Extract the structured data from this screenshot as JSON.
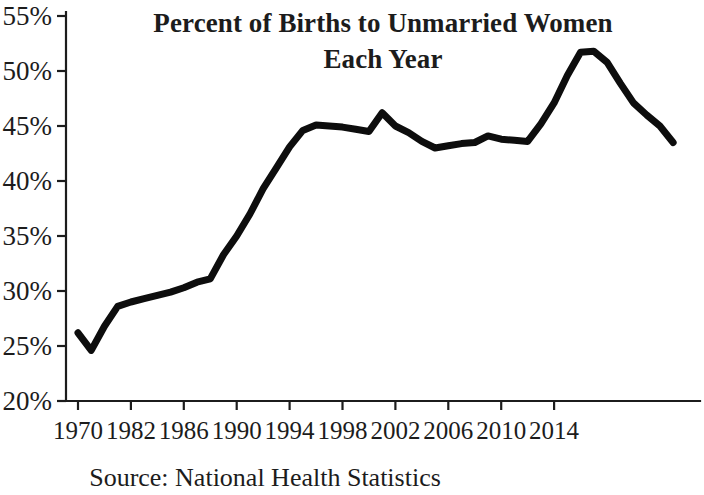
{
  "chart_data": {
    "type": "line",
    "title": "Percent of Births to Unmarried Women Each Year",
    "title_line1": "Percent of Births to Unmarried Women",
    "title_line2": "Each Year",
    "source": "Source: National Health Statistics",
    "xlabel": "",
    "ylabel": "",
    "ylim": [
      20,
      55
    ],
    "ytick_values": [
      55,
      50,
      45,
      40,
      35,
      30,
      25,
      20
    ],
    "ytick_labels": [
      "55%",
      "50%",
      "45%",
      "40%",
      "35%",
      "30%",
      "25%",
      "20%"
    ],
    "xtick_labels": [
      "1970",
      "1982",
      "1986",
      "1990",
      "1994",
      "1998",
      "2002",
      "2006",
      "2010",
      "2014"
    ],
    "xtick_index_positions": [
      0,
      4,
      8,
      12,
      16,
      20,
      24,
      28,
      32,
      36
    ],
    "grid": false,
    "legend": false,
    "line_color": "#0d0d0d",
    "x": [
      "1970",
      "1971",
      "1972",
      "1973",
      "1974",
      "1975",
      "1976",
      "1977",
      "1978",
      "1979",
      "1980",
      "1981",
      "1982",
      "1983",
      "1984",
      "1985",
      "1986",
      "1987",
      "1988",
      "1989",
      "1990",
      "1991",
      "1992",
      "1993",
      "1994",
      "1995",
      "1996",
      "1997",
      "1998",
      "1999",
      "2000",
      "2001",
      "2002",
      "2003",
      "2004",
      "2005",
      "2006",
      "2007",
      "2008",
      "2009",
      "2010",
      "2011",
      "2012",
      "2013",
      "2014",
      "2015"
    ],
    "values": [
      26.2,
      24.6,
      26.8,
      28.6,
      29.0,
      29.3,
      29.6,
      29.9,
      30.3,
      30.8,
      31.1,
      33.3,
      35.0,
      37.0,
      39.3,
      41.2,
      43.1,
      44.6,
      45.1,
      45.0,
      44.9,
      44.7,
      44.5,
      46.2,
      45.0,
      44.4,
      43.6,
      43.0,
      43.2,
      43.4,
      43.5,
      44.1,
      43.8,
      43.7,
      43.6,
      45.2,
      47.1,
      49.6,
      51.7,
      51.8,
      50.8,
      48.9,
      47.1,
      46.0,
      45.0,
      43.5
    ]
  }
}
